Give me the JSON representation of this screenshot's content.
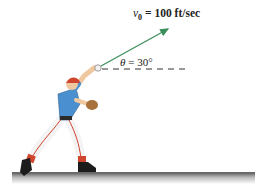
{
  "figure": {
    "velocity_label": {
      "symbol": "v",
      "subscript": "0",
      "equals": " = ",
      "value": "100 ft/sec"
    },
    "angle_label": {
      "symbol": "θ",
      "equals": " = ",
      "value": "30°"
    },
    "colors": {
      "arrow": "#3a8f5a",
      "jersey": "#4a8fd0",
      "cap": "#d0452e",
      "pants": "#f4f4f4",
      "stripes": "#d0452e",
      "shoes": "#1c1c1c",
      "glove": "#a8703a",
      "skin": "#f0c8a0",
      "ground": "#8a8a8a",
      "dash": "#333333"
    }
  }
}
